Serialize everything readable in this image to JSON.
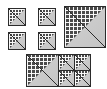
{
  "figure": {
    "title": "",
    "canvas": {
      "width": 107,
      "height": 89,
      "background": "#ffffff"
    },
    "palette": {
      "outline": "#2b2b2b",
      "hatch_fill": "#4a4a4a",
      "hatch_line": "#ffffff",
      "light_fill": "#c9c9c9"
    },
    "tile_description": {
      "upper_left": "dark cross-hatched triangle",
      "lower_right": "plain light gray triangle",
      "shape": "square split along the anti-diagonal"
    },
    "groups": [
      {
        "name": "small-tile-row-top",
        "label": "",
        "tiles": [
          {
            "name": "tile-1",
            "x": 8,
            "y": 8,
            "size": 18
          },
          {
            "name": "tile-2",
            "x": 38,
            "y": 8,
            "size": 18
          }
        ]
      },
      {
        "name": "small-tile-row-bottom",
        "label": "",
        "tiles": [
          {
            "name": "tile-3",
            "x": 8,
            "y": 32,
            "size": 18
          },
          {
            "name": "tile-4",
            "x": 38,
            "y": 32,
            "size": 18
          }
        ]
      },
      {
        "name": "large-tile-group",
        "label": "",
        "tiles": [
          {
            "name": "tile-large",
            "x": 64,
            "y": 6,
            "size": 42
          }
        ]
      },
      {
        "name": "composite-group",
        "label": "",
        "x": 26,
        "y": 54,
        "width": 62,
        "height": 33,
        "tiles": [
          {
            "name": "composite-tile-large",
            "x": 0,
            "y": 0,
            "size": 33
          },
          {
            "name": "composite-tile-small-1",
            "x": 33,
            "y": 0,
            "size": 16
          },
          {
            "name": "composite-tile-small-2",
            "x": 48,
            "y": 0,
            "size": 16
          },
          {
            "name": "composite-tile-small-3",
            "x": 33,
            "y": 16,
            "size": 16
          },
          {
            "name": "composite-tile-small-4",
            "x": 48,
            "y": 16,
            "size": 16
          }
        ]
      }
    ]
  }
}
